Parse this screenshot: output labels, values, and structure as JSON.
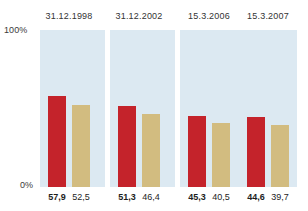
{
  "chart_data": {
    "type": "bar",
    "title": "",
    "subtitle": "",
    "xlabel": "",
    "ylabel": "",
    "ylim": [
      0,
      100
    ],
    "grid": false,
    "legend_position": "none",
    "categories": [
      "31.12.1998",
      "31.12.2002",
      "15.3.2006",
      "15.3.2007"
    ],
    "series": [
      {
        "name": "primary",
        "color": "#c4232b",
        "values": [
          57.9,
          46.4,
          45.3,
          44.6
        ],
        "value_labels": [
          "57,9",
          "51,3",
          "45,3",
          "44,6"
        ]
      },
      {
        "name": "secondary",
        "color": "#d2bc80",
        "values": [
          52.5,
          46.4,
          40.5,
          39.7
        ],
        "value_labels": [
          "52,5",
          "46,4",
          "40,5",
          "39,7"
        ]
      }
    ],
    "axis": {
      "top_tick_label": "100%",
      "bottom_tick_label": "0%"
    },
    "panel_background": "#dce9f2"
  },
  "panels": [
    {
      "header": "31.12.1998",
      "primary_label": "57,9",
      "secondary_label": "52,5",
      "primary_value": 57.9,
      "secondary_value": 52.5
    },
    {
      "header": "31.12.2002",
      "primary_label": "51,3",
      "secondary_label": "46,4",
      "primary_value": 51.3,
      "secondary_value": 46.4
    },
    {
      "header": "15.3.2006",
      "primary_label": "45,3",
      "secondary_label": "40,5",
      "primary_value": 45.3,
      "secondary_value": 40.5
    },
    {
      "header": "15.3.2007",
      "primary_label": "44,6",
      "secondary_label": "39,7",
      "primary_value": 44.6,
      "secondary_value": 39.7
    }
  ],
  "axis": {
    "top": "100%",
    "bottom": "0%"
  }
}
